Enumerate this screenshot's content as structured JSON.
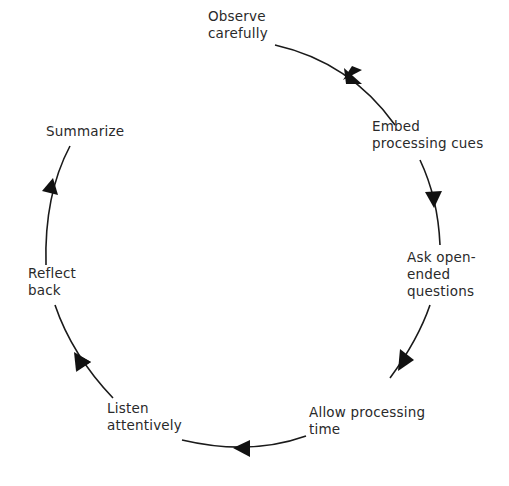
{
  "diagram": {
    "type": "cycle",
    "direction": "clockwise",
    "stroke_color": "#1a1a1a",
    "text_color": "#2a2a2a",
    "steps": [
      {
        "id": "observe",
        "lines": [
          "Observe",
          "carefully"
        ]
      },
      {
        "id": "embed",
        "lines": [
          "Embed",
          "processing cues"
        ]
      },
      {
        "id": "ask",
        "lines": [
          "Ask open-",
          "ended",
          "questions"
        ]
      },
      {
        "id": "allow",
        "lines": [
          "Allow processing",
          "time"
        ]
      },
      {
        "id": "listen",
        "lines": [
          "Listen",
          "attentively"
        ]
      },
      {
        "id": "reflect",
        "lines": [
          "Reflect",
          "back"
        ]
      },
      {
        "id": "summarize",
        "lines": [
          "Summarize"
        ]
      }
    ]
  }
}
